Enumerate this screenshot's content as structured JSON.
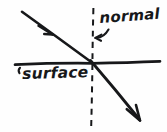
{
  "diagram": {
    "kind": "physics-refraction-sketch",
    "style": "hand-drawn",
    "background_color": "#fefefe",
    "ink_color": "#17181a",
    "labels": {
      "normal": "normal",
      "surface": "surface"
    },
    "elements": {
      "surface_line": {
        "name": "surface-line",
        "description": "horizontal boundary line",
        "x1": 15,
        "y1": 64,
        "x2": 160,
        "y2": 61,
        "stroke_width": 2.6,
        "dashed": false
      },
      "normal_line": {
        "name": "normal-dashed-line",
        "description": "vertical dashed normal to the surface",
        "x1": 93,
        "y1": 8,
        "x2": 91,
        "y2": 126,
        "stroke_width": 1.9,
        "dashed": true,
        "dash_pattern": "6 5"
      },
      "incident_ray": {
        "name": "incident-ray",
        "description": "incoming ray from upper left to interface",
        "x1": 22,
        "y1": 12,
        "x2": 92,
        "y2": 63,
        "stroke_width": 2.6,
        "arrow_at": {
          "x": 50,
          "y": 32
        }
      },
      "refracted_ray": {
        "name": "refracted-ray",
        "description": "outgoing ray bending toward lower right",
        "x1": 92,
        "y1": 63,
        "x2": 140,
        "y2": 120,
        "stroke_width": 2.8,
        "arrow_at": {
          "x": 138,
          "y": 118
        }
      },
      "normal_pointer": {
        "name": "normal-pointer-arrow",
        "description": "small curved arrow from the word normal to the dashed line"
      },
      "surface_pointer": {
        "name": "surface-pointer-tick",
        "description": "small tick mark from the word surface to the horizontal line"
      },
      "intersection": {
        "name": "incidence-point",
        "x": 92,
        "y": 63
      }
    }
  }
}
